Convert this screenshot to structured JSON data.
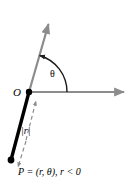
{
  "figure": {
    "labels": {
      "origin": "O",
      "angle": "θ",
      "magnitude": "|r|",
      "point": "P = (r, θ), r < 0"
    },
    "colors": {
      "background": "#ffffff",
      "axis": "#8c8c8c",
      "ray": "#8c8c8c",
      "arc": "#1a1a1a",
      "segment": "#000000",
      "dashed": "#8c8c8c",
      "text": "#000000"
    },
    "geometry": {
      "origin": {
        "x": 29,
        "y": 92
      },
      "point_p": {
        "x": 11,
        "y": 160
      },
      "polar_axis_end": {
        "x": 128,
        "y": 92
      },
      "ray_end": {
        "x": 50,
        "y": 20
      },
      "angle_degrees": 73,
      "arc_radius": 38
    }
  }
}
